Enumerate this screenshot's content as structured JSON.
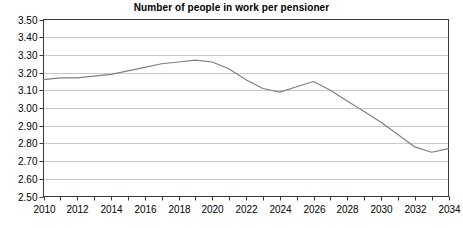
{
  "chart_data": {
    "type": "line",
    "title": "Number of people in work per pensioner",
    "xlabel": "",
    "ylabel": "",
    "grid": true,
    "legend": false,
    "xlim": [
      2010,
      2034
    ],
    "ylim": [
      2.5,
      3.5
    ],
    "ytick_step": 0.1,
    "xtick_step": 1,
    "xlabel_step": 2,
    "line_color": "#808080",
    "axis_color": "#3a3a3a",
    "grid_color": "#c8c8c8",
    "yticks": [
      "3.50",
      "3.40",
      "3.30",
      "3.20",
      "3.10",
      "3.00",
      "2.90",
      "2.80",
      "2.70",
      "2.60",
      "2.50"
    ],
    "xticks": [
      "2010",
      "2011",
      "2012",
      "2013",
      "2014",
      "2015",
      "2016",
      "2017",
      "2018",
      "2019",
      "2020",
      "2021",
      "2022",
      "2023",
      "2024",
      "2025",
      "2026",
      "2027",
      "2028",
      "2029",
      "2030",
      "2031",
      "2032",
      "2033",
      "2034"
    ],
    "xtick_labels": [
      "2010",
      "2012",
      "2014",
      "2016",
      "2018",
      "2020",
      "2022",
      "2024",
      "2026",
      "2028",
      "2030",
      "2032",
      "2034"
    ],
    "x": [
      2010,
      2011,
      2012,
      2013,
      2014,
      2015,
      2016,
      2017,
      2018,
      2019,
      2020,
      2021,
      2022,
      2023,
      2024,
      2025,
      2026,
      2027,
      2028,
      2029,
      2030,
      2031,
      2032,
      2033,
      2034
    ],
    "values": [
      3.16,
      3.17,
      3.17,
      3.18,
      3.19,
      3.21,
      3.23,
      3.25,
      3.26,
      3.27,
      3.26,
      3.22,
      3.16,
      3.11,
      3.09,
      3.12,
      3.15,
      3.1,
      3.04,
      2.98,
      2.92,
      2.85,
      2.78,
      2.75,
      2.77
    ],
    "series": [
      {
        "name": "Number of people in work per pensioner",
        "values": [
          3.16,
          3.17,
          3.17,
          3.18,
          3.19,
          3.21,
          3.23,
          3.25,
          3.26,
          3.27,
          3.26,
          3.22,
          3.16,
          3.11,
          3.09,
          3.12,
          3.15,
          3.1,
          3.04,
          2.98,
          2.92,
          2.85,
          2.78,
          2.75,
          2.77
        ]
      }
    ]
  }
}
